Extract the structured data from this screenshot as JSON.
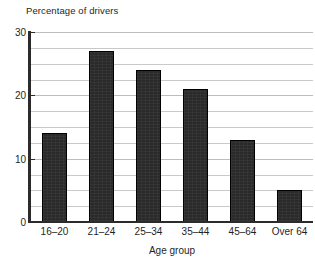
{
  "chart_data": {
    "type": "bar",
    "title": "",
    "ylabel": "Percentage of drivers",
    "xlabel": "Age group",
    "categories": [
      "16–20",
      "21–24",
      "25–34",
      "35–44",
      "45–64",
      "Over 64"
    ],
    "values": [
      14,
      27,
      24,
      21,
      13,
      5
    ],
    "ylim": [
      0,
      30
    ],
    "ytick_labels": [
      "0",
      "10",
      "20",
      "30"
    ],
    "ytick_values": [
      0,
      10,
      20,
      30
    ],
    "gridlines": {
      "visible": true,
      "values": [
        2.5,
        5,
        7.5,
        10,
        12.5,
        15,
        17.5,
        20,
        22.5,
        25,
        27.5,
        30
      ],
      "major_values": [
        0,
        10,
        20,
        30
      ],
      "color": "#c9c9c9"
    },
    "legend": null,
    "bar_color": "#2a2a2a",
    "bar_edge_color": "#000000",
    "axis_color": "#2b2b2b",
    "background": "#ffffff"
  },
  "labels": {
    "y_axis_title": "Percentage of drivers",
    "x_axis_title": "Age group"
  }
}
